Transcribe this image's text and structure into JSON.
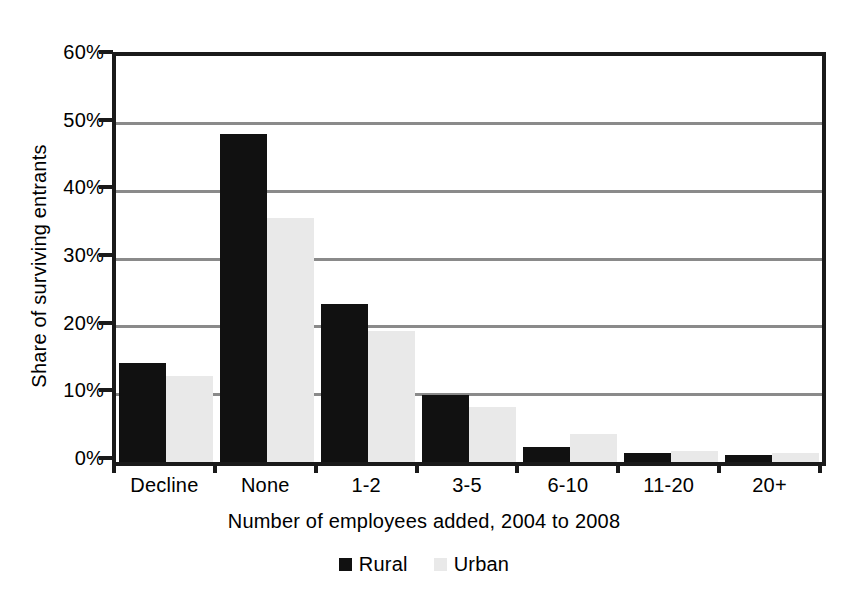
{
  "chart_data": {
    "type": "bar",
    "title": "",
    "subtitle": "",
    "xlabel": "Number of employees added, 2004 to 2008",
    "ylabel": "Share of surviving entrants",
    "categories": [
      "Decline",
      "None",
      "1-2",
      "3-5",
      "6-10",
      "11-20",
      "20+"
    ],
    "series": [
      {
        "name": "Rural",
        "color": "#111111",
        "values": [
          14.7,
          48.5,
          23.4,
          9.9,
          2.2,
          1.3,
          1.0
        ]
      },
      {
        "name": "Urban",
        "color": "#e9e9e9",
        "values": [
          12.7,
          36.1,
          19.3,
          8.2,
          4.2,
          1.6,
          1.4
        ]
      }
    ],
    "ylim": [
      0,
      60
    ],
    "ytick_values": [
      0,
      10,
      20,
      30,
      40,
      50,
      60
    ],
    "ytick_labels": [
      "0%",
      "10%",
      "20%",
      "30%",
      "40%",
      "50%",
      "60%"
    ],
    "y_unit": "%",
    "grid": "horizontal",
    "legend_position": "bottom",
    "legend_entries": [
      "Rural",
      "Urban"
    ],
    "gridline_color": "#8a8a8a",
    "axis_color": "#1a1a1a",
    "background_color": "#ffffff"
  }
}
